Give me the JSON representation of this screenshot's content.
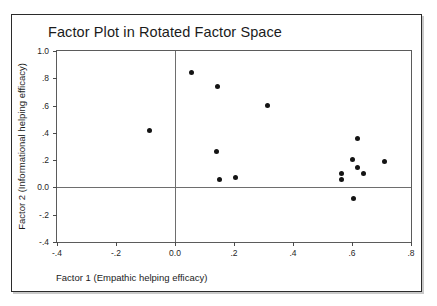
{
  "figure": {
    "title": "Factor Plot in Rotated Factor Space",
    "xlabel": "Factor 1 (Empathic helping efficacy)",
    "ylabel": "Factor 2 (Informational helping efficacy)"
  },
  "chart_data": {
    "type": "scatter",
    "title": "Factor Plot in Rotated Factor Space",
    "xlabel": "Factor 1 (Empathic helping efficacy)",
    "ylabel": "Factor 2 (Informational helping efficacy)",
    "xlim": [
      -0.4,
      0.8
    ],
    "ylim": [
      -0.4,
      1.0
    ],
    "grid": false,
    "legend": null,
    "xticks": [
      -0.4,
      -0.2,
      0.0,
      0.2,
      0.4,
      0.6,
      0.8
    ],
    "xticklabels": [
      "-.4",
      "-.2",
      "0.0",
      ".2",
      ".4",
      ".6",
      ".8"
    ],
    "yticks": [
      -0.4,
      -0.2,
      0.0,
      0.2,
      0.4,
      0.6,
      0.8,
      1.0
    ],
    "yticklabels": [
      "-.4",
      "-.2",
      "0.0",
      ".2",
      ".4",
      ".6",
      ".8",
      "1.0"
    ],
    "reference_lines": {
      "x": 0.0,
      "y": 0.0
    },
    "marker": {
      "shape": "circle",
      "color": "#141414",
      "size": 5
    },
    "points": [
      {
        "x": -0.085,
        "y": 0.42
      },
      {
        "x": 0.055,
        "y": 0.84
      },
      {
        "x": 0.145,
        "y": 0.74
      },
      {
        "x": 0.315,
        "y": 0.6
      },
      {
        "x": 0.14,
        "y": 0.26
      },
      {
        "x": 0.15,
        "y": 0.055
      },
      {
        "x": 0.205,
        "y": 0.07
      },
      {
        "x": 0.565,
        "y": 0.1
      },
      {
        "x": 0.565,
        "y": 0.055
      },
      {
        "x": 0.62,
        "y": 0.355
      },
      {
        "x": 0.6,
        "y": 0.205
      },
      {
        "x": 0.62,
        "y": 0.145
      },
      {
        "x": 0.64,
        "y": 0.1
      },
      {
        "x": 0.605,
        "y": -0.08
      },
      {
        "x": 0.71,
        "y": 0.19
      }
    ]
  }
}
